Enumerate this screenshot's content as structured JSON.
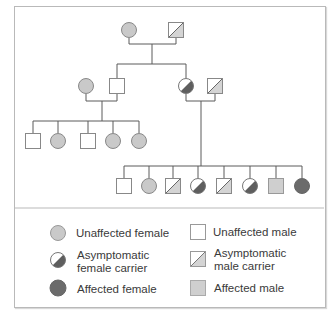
{
  "colors": {
    "line": "#5a5a5a",
    "unaffected_female_fill": "#c9c9c9",
    "unaffected_male_fill": "#ffffff",
    "affected_female_fill": "#6b6b6b",
    "affected_male_fill": "#cfcfcf",
    "carrier_dark": "#5e5e5e",
    "carrier_light": "#d4d4d4"
  },
  "pedigree": {
    "generations": [
      {
        "id": "I",
        "individuals": [
          {
            "sex": "female",
            "status": "unaffected"
          },
          {
            "sex": "male",
            "status": "asymptomatic_carrier"
          }
        ]
      },
      {
        "id": "II",
        "individuals": [
          {
            "sex": "female",
            "status": "unaffected"
          },
          {
            "sex": "male",
            "status": "unaffected"
          },
          {
            "sex": "female",
            "status": "asymptomatic_carrier"
          },
          {
            "sex": "male",
            "status": "asymptomatic_carrier"
          }
        ]
      },
      {
        "id": "III",
        "individuals": [
          {
            "sex": "male",
            "status": "unaffected"
          },
          {
            "sex": "female",
            "status": "unaffected"
          },
          {
            "sex": "male",
            "status": "unaffected"
          },
          {
            "sex": "female",
            "status": "unaffected"
          },
          {
            "sex": "female",
            "status": "unaffected"
          }
        ]
      },
      {
        "id": "IV",
        "individuals": [
          {
            "sex": "male",
            "status": "unaffected"
          },
          {
            "sex": "female",
            "status": "unaffected"
          },
          {
            "sex": "male",
            "status": "asymptomatic_carrier"
          },
          {
            "sex": "female",
            "status": "asymptomatic_carrier"
          },
          {
            "sex": "male",
            "status": "asymptomatic_carrier"
          },
          {
            "sex": "female",
            "status": "asymptomatic_carrier"
          },
          {
            "sex": "male",
            "status": "affected"
          },
          {
            "sex": "female",
            "status": "affected"
          }
        ]
      }
    ]
  },
  "legend": {
    "items": [
      {
        "symbol": "unaffected-female",
        "label": "Unaffected female"
      },
      {
        "symbol": "unaffected-male",
        "label": "Unaffected male"
      },
      {
        "symbol": "carrier-female",
        "label_line1": "Asymptomatic",
        "label_line2": "female carrier"
      },
      {
        "symbol": "carrier-male",
        "label_line1": "Asymptomatic",
        "label_line2": "male carrier"
      },
      {
        "symbol": "affected-female",
        "label": "Affected female"
      },
      {
        "symbol": "affected-male",
        "label": "Affected male"
      }
    ]
  }
}
